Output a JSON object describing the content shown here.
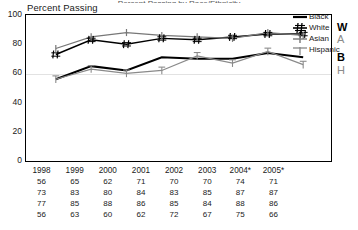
{
  "title_clipped": "Percent Passing by Race/Ethnicity",
  "axis": {
    "ylabel": "Percent Passing",
    "yticks": [
      "100",
      "80",
      "60",
      "40",
      "20",
      "0"
    ]
  },
  "edge_labels": {
    "white": "W",
    "asian": "A",
    "black": "B",
    "hispanic": "H"
  },
  "table": {
    "years": [
      "1998",
      "1999",
      "2000",
      "2001",
      "2002",
      "2003",
      "2004*",
      "2005*"
    ],
    "rows": [
      {
        "name": "Black",
        "values": [
          "56",
          "65",
          "62",
          "71",
          "70",
          "70",
          "74",
          "71"
        ]
      },
      {
        "name": "White",
        "values": [
          "73",
          "83",
          "80",
          "84",
          "83",
          "85",
          "87",
          "87"
        ]
      },
      {
        "name": "Asian",
        "values": [
          "77",
          "85",
          "88",
          "86",
          "85",
          "84",
          "88",
          "86"
        ]
      },
      {
        "name": "Hispanic",
        "values": [
          "56",
          "63",
          "60",
          "62",
          "72",
          "67",
          "75",
          "66"
        ]
      }
    ]
  },
  "legend": [
    {
      "label": "Black",
      "marker": "solid-line-marker"
    },
    {
      "label": "White",
      "marker": "hash-marker"
    },
    {
      "label": "Asian",
      "marker": "plus-marker"
    },
    {
      "label": "Hispanic",
      "marker": "tee-marker"
    }
  ],
  "colors": {
    "black_series": "#000000",
    "white_series": "#000000",
    "asian_series": "#777777",
    "hispanic_series": "#888888",
    "grid": "#e2e2e2",
    "axis": "#000000"
  },
  "chart_data": {
    "type": "line",
    "title": "Percent Passing by Race/Ethnicity",
    "xlabel": "",
    "ylabel": "Percent Passing",
    "ylim": [
      0,
      100
    ],
    "yticks": [
      0,
      20,
      40,
      60,
      80,
      100
    ],
    "grid": true,
    "legend_position": "right",
    "categories": [
      "1998",
      "1999",
      "2000",
      "2001",
      "2002",
      "2003",
      "2004*",
      "2005*"
    ],
    "series": [
      {
        "name": "Black",
        "values": [
          56,
          65,
          62,
          71,
          70,
          70,
          74,
          71
        ]
      },
      {
        "name": "White",
        "values": [
          73,
          83,
          80,
          84,
          83,
          85,
          87,
          87
        ]
      },
      {
        "name": "Asian",
        "values": [
          77,
          85,
          88,
          86,
          85,
          84,
          88,
          86
        ]
      },
      {
        "name": "Hispanic",
        "values": [
          56,
          63,
          60,
          62,
          72,
          67,
          75,
          66
        ]
      }
    ],
    "annotations": [
      "W",
      "A",
      "B",
      "H"
    ]
  }
}
